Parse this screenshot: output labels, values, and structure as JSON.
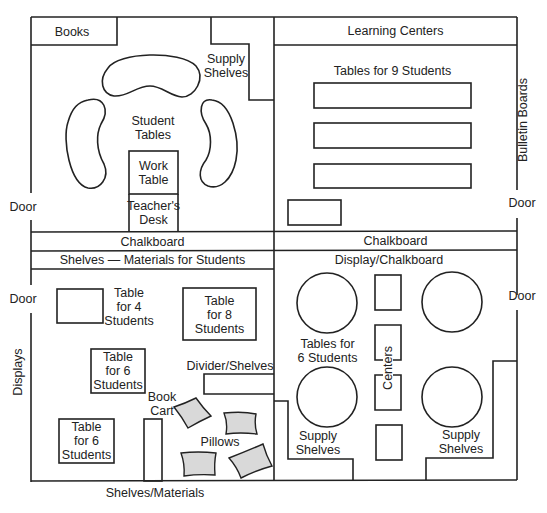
{
  "diagram": {
    "type": "classroom-floor-plan",
    "colors": {
      "line": "#222222",
      "pillow_fill": "#d9d9d9",
      "background": "#ffffff"
    },
    "top_left_room": {
      "books": "Books",
      "supply_shelves": [
        "Supply",
        "Shelves"
      ],
      "student_tables": [
        "Student",
        "Tables"
      ],
      "work_table": [
        "Work",
        "Table"
      ],
      "teachers_desk": [
        "Teacher's",
        "Desk"
      ],
      "door": "Door"
    },
    "top_right_room": {
      "learning_centers": "Learning Centers",
      "tables_for_9": "Tables for 9 Students",
      "bulletin_boards": "Bulletin Boards",
      "door": "Door"
    },
    "divider_bands": {
      "left_chalkboard": "Chalkboard",
      "right_chalkboard": "Chalkboard",
      "shelves_materials": "Shelves — Materials for Students"
    },
    "bottom_left_room": {
      "door": "Door",
      "displays": "Displays",
      "table_for_4": [
        "Table",
        "for 4",
        "Students"
      ],
      "table_for_8": [
        "Table",
        "for 8",
        "Students"
      ],
      "table_for_6_a": [
        "Table",
        "for 6",
        "Students"
      ],
      "table_for_6_b": [
        "Table",
        "for 6",
        "Students"
      ],
      "divider_shelves": "Divider/Shelves",
      "book_cart": [
        "Book",
        "Cart"
      ],
      "pillows": "Pillows",
      "shelves_materials": "Shelves/Materials"
    },
    "bottom_right_room": {
      "display_chalkboard": "Display/Chalkboard",
      "tables_for_6": [
        "Tables for",
        "6 Students"
      ],
      "centers": "Centers",
      "supply_shelves_left": [
        "Supply",
        "Shelves"
      ],
      "supply_shelves_right": [
        "Supply",
        "Shelves"
      ],
      "door": "Door"
    }
  }
}
